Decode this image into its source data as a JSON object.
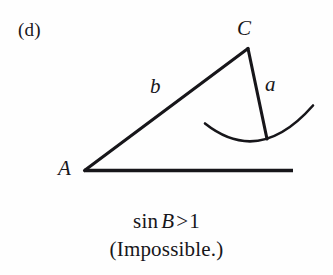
{
  "figure": {
    "panel_label": "(d)",
    "background_color": "#fefefe",
    "ink_color": "#17161a"
  },
  "triangle": {
    "vertices": [
      {
        "name": "A",
        "label": "A",
        "x": 84,
        "y": 171
      },
      {
        "name": "C",
        "label": "C",
        "x": 248,
        "y": 48
      }
    ],
    "sides": [
      {
        "name": "b",
        "label": "b",
        "from": "A",
        "to": "C",
        "label_x": 157,
        "label_y": 88
      },
      {
        "name": "a",
        "label": "a",
        "from": "C",
        "to": "swing-end",
        "label_x": 271,
        "label_y": 86
      }
    ],
    "baseline": {
      "x1": 84,
      "y1": 171,
      "x2": 293,
      "y2": 171
    },
    "side_a_segment": {
      "x1": 248,
      "y1": 48,
      "x2": 267,
      "y2": 139
    },
    "arc": {
      "name": "swing-arc",
      "start_x": 205,
      "start_y": 124,
      "control_x": 259,
      "control_y": 166,
      "end_x": 313,
      "end_y": 106
    }
  },
  "caption": {
    "line1": {
      "function": "sin",
      "variable": "B",
      "relation": ">",
      "value": "1"
    },
    "line2": "(Impossible.)"
  }
}
